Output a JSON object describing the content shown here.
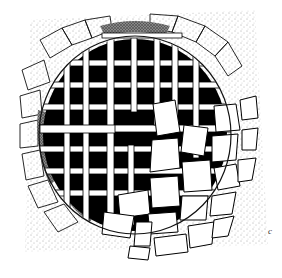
{
  "illustration": {
    "subject": "ink drawing of a round grated drain opening with iron bars, surrounded by stippled paving and partially covered by stone blocks",
    "figure_label": "c",
    "colors": {
      "ink": "#000000",
      "paper": "#ffffff",
      "stipple": "#555555"
    }
  }
}
